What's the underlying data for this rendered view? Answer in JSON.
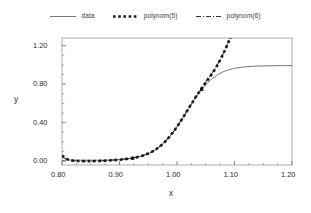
{
  "chart_data": {
    "type": "line",
    "title": "",
    "xlabel": "x",
    "ylabel": "y",
    "xlim": [
      0.8,
      1.2
    ],
    "ylim": [
      -0.04,
      1.28
    ],
    "xticks": [
      "0.80",
      "0.90",
      "1.00",
      "1.10",
      "1.20"
    ],
    "xtick_values": [
      0.8,
      0.9,
      1.0,
      1.1,
      1.2
    ],
    "yticks": [
      "0.00",
      "0.40",
      "0.80",
      "1.20"
    ],
    "ytick_values": [
      0.0,
      0.4,
      0.8,
      1.2
    ],
    "minor_ticks_per_interval": 3,
    "grid": false,
    "legend_position": "top-outside",
    "series": [
      {
        "name": "data",
        "style": "solid-thin",
        "color": "#555555",
        "points": [
          [
            0.8,
            0.005
          ],
          [
            0.805,
            0.01
          ],
          [
            0.81,
            0.012
          ],
          [
            0.815,
            0.012
          ],
          [
            0.82,
            0.011
          ],
          [
            0.83,
            0.01
          ],
          [
            0.84,
            0.009
          ],
          [
            0.85,
            0.009
          ],
          [
            0.86,
            0.009
          ],
          [
            0.87,
            0.01
          ],
          [
            0.88,
            0.011
          ],
          [
            0.89,
            0.013
          ],
          [
            0.9,
            0.016
          ],
          [
            0.91,
            0.021
          ],
          [
            0.92,
            0.028
          ],
          [
            0.93,
            0.039
          ],
          [
            0.94,
            0.055
          ],
          [
            0.95,
            0.077
          ],
          [
            0.96,
            0.108
          ],
          [
            0.97,
            0.15
          ],
          [
            0.98,
            0.205
          ],
          [
            0.99,
            0.274
          ],
          [
            1.0,
            0.356
          ],
          [
            1.01,
            0.447
          ],
          [
            1.02,
            0.543
          ],
          [
            1.03,
            0.637
          ],
          [
            1.04,
            0.722
          ],
          [
            1.05,
            0.795
          ],
          [
            1.06,
            0.853
          ],
          [
            1.07,
            0.897
          ],
          [
            1.08,
            0.928
          ],
          [
            1.09,
            0.95
          ],
          [
            1.1,
            0.965
          ],
          [
            1.11,
            0.974
          ],
          [
            1.12,
            0.981
          ],
          [
            1.13,
            0.985
          ],
          [
            1.14,
            0.988
          ],
          [
            1.15,
            0.99
          ],
          [
            1.16,
            0.991
          ],
          [
            1.17,
            0.992
          ],
          [
            1.18,
            0.993
          ],
          [
            1.19,
            0.993
          ],
          [
            1.2,
            0.994
          ]
        ]
      },
      {
        "name": "polynom(5)",
        "style": "dotted-thick",
        "color": "#1a1a1a",
        "points": [
          [
            0.8,
            0.06
          ],
          [
            0.806,
            0.03
          ],
          [
            0.812,
            0.013
          ],
          [
            0.82,
            0.004
          ],
          [
            0.83,
            0.001
          ],
          [
            0.84,
            0.0
          ],
          [
            0.85,
            0.0
          ],
          [
            0.86,
            0.001
          ],
          [
            0.87,
            0.003
          ],
          [
            0.88,
            0.006
          ],
          [
            0.89,
            0.01
          ],
          [
            0.9,
            0.015
          ],
          [
            0.91,
            0.021
          ],
          [
            0.92,
            0.029
          ],
          [
            0.93,
            0.041
          ],
          [
            0.94,
            0.057
          ],
          [
            0.95,
            0.079
          ],
          [
            0.96,
            0.109
          ],
          [
            0.97,
            0.151
          ],
          [
            0.98,
            0.206
          ],
          [
            0.99,
            0.275
          ],
          [
            1.0,
            0.357
          ],
          [
            1.01,
            0.449
          ],
          [
            1.02,
            0.546
          ],
          [
            1.03,
            0.642
          ],
          [
            1.04,
            0.733
          ],
          [
            1.05,
            0.818
          ],
          [
            1.06,
            0.9
          ],
          [
            1.065,
            0.945
          ],
          [
            1.07,
            0.995
          ],
          [
            1.075,
            1.05
          ],
          [
            1.08,
            1.11
          ],
          [
            1.085,
            1.175
          ],
          [
            1.09,
            1.245
          ],
          [
            1.094,
            1.29
          ]
        ]
      },
      {
        "name": "polynom(6)",
        "style": "dashdot",
        "color": "#1a1a1a",
        "points": [
          [
            0.8,
            0.045
          ],
          [
            0.807,
            0.022
          ],
          [
            0.815,
            0.008
          ],
          [
            0.825,
            0.002
          ],
          [
            0.835,
            0.0
          ],
          [
            0.845,
            0.0
          ],
          [
            0.855,
            0.001
          ],
          [
            0.865,
            0.002
          ],
          [
            0.875,
            0.005
          ],
          [
            0.885,
            0.009
          ],
          [
            0.895,
            0.014
          ],
          [
            0.905,
            0.019
          ],
          [
            0.915,
            0.026
          ],
          [
            0.925,
            0.035
          ],
          [
            0.935,
            0.049
          ],
          [
            0.945,
            0.068
          ],
          [
            0.955,
            0.094
          ],
          [
            0.965,
            0.129
          ],
          [
            0.975,
            0.178
          ],
          [
            0.985,
            0.24
          ],
          [
            0.995,
            0.316
          ],
          [
            1.005,
            0.404
          ],
          [
            1.015,
            0.498
          ],
          [
            1.025,
            0.595
          ],
          [
            1.035,
            0.69
          ],
          [
            1.045,
            0.78
          ],
          [
            1.055,
            0.866
          ],
          [
            1.062,
            0.925
          ],
          [
            1.068,
            0.98
          ],
          [
            1.074,
            1.042
          ],
          [
            1.08,
            1.112
          ],
          [
            1.086,
            1.19
          ],
          [
            1.091,
            1.265
          ],
          [
            1.094,
            1.29
          ]
        ]
      }
    ],
    "markers": [
      {
        "x": 0.923,
        "y": 0.03,
        "note": "knot-marker-low"
      },
      {
        "x": 1.043,
        "y": 0.745,
        "note": "knot-marker-high"
      }
    ],
    "legend": [
      {
        "label": "data",
        "style": "solid-thin"
      },
      {
        "label": "polynom(5)",
        "style": "dotted-thick"
      },
      {
        "label": "polynom(6)",
        "style": "dashdot"
      }
    ]
  }
}
